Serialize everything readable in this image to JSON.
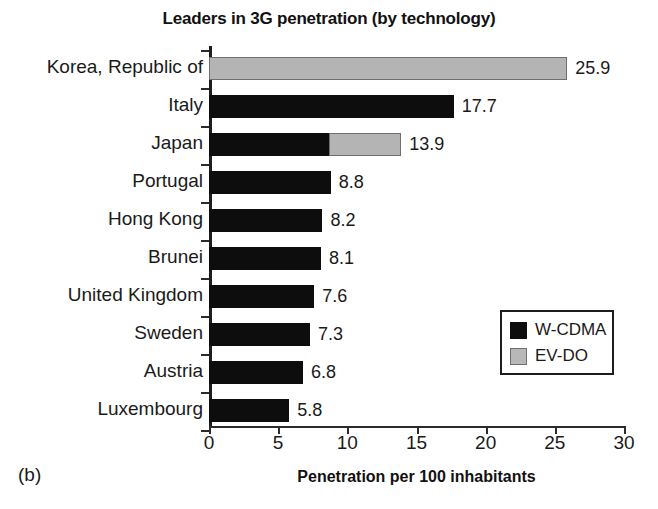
{
  "figure": {
    "panel_label": "(b)"
  },
  "legend": {
    "position": "inside-right-lower",
    "entries": [
      {
        "label": "W-CDMA",
        "color": "#0d0d0d",
        "swatch": "black"
      },
      {
        "label": "EV-DO",
        "color": "#b8b8b8",
        "swatch": "gray"
      }
    ]
  },
  "chart_data": {
    "type": "bar",
    "orientation": "horizontal",
    "stacked": true,
    "title": "Leaders in 3G penetration (by technology)",
    "xlabel": "Penetration per 100 inhabitants",
    "ylabel": "",
    "xlim": [
      0,
      30
    ],
    "xticks": [
      0,
      5,
      10,
      15,
      20,
      25,
      30
    ],
    "xtick_labels": [
      "0",
      "5",
      "10",
      "15",
      "20",
      "25",
      "30"
    ],
    "grid": false,
    "categories": [
      "Korea, Republic of",
      "Italy",
      "Japan",
      "Portugal",
      "Hong Kong",
      "Brunei",
      "United Kingdom",
      "Sweden",
      "Austria",
      "Luxembourg"
    ],
    "series": [
      {
        "name": "W-CDMA",
        "color": "#0d0d0d",
        "values": [
          0,
          17.7,
          8.7,
          8.8,
          8.2,
          8.1,
          7.6,
          7.3,
          6.8,
          5.8
        ]
      },
      {
        "name": "EV-DO",
        "color": "#b8b8b8",
        "values": [
          25.9,
          0,
          5.2,
          0,
          0,
          0,
          0,
          0,
          0,
          0
        ]
      }
    ],
    "totals": [
      25.9,
      17.7,
      13.9,
      8.8,
      8.2,
      8.1,
      7.6,
      7.3,
      6.8,
      5.8
    ],
    "data_labels": [
      "25.9",
      "17.7",
      "13.9",
      "8.8",
      "8.2",
      "8.1",
      "7.6",
      "7.3",
      "6.8",
      "5.8"
    ]
  }
}
